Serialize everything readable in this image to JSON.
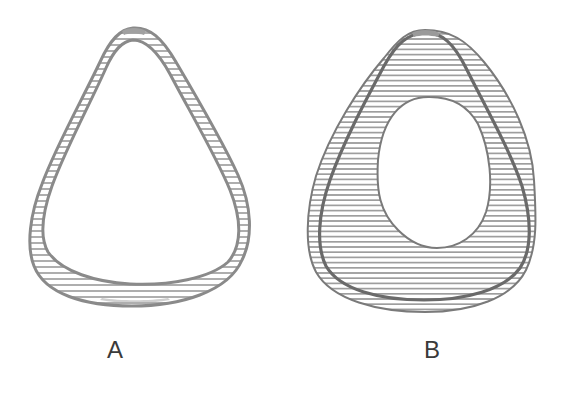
{
  "figure": {
    "panels": [
      {
        "label": "A",
        "description": "Thin-walled teardrop-shaped cross-section with horizontally hatched wall, thicker at the base"
      },
      {
        "label": "B",
        "description": "Thick-walled teardrop-shaped cross-section with horizontally hatched wall, inner outline of shape A overlaid as a dark line, and a smaller oval lumen"
      }
    ],
    "colors": {
      "outline": "#8a8a8a",
      "outline_dark": "#6a6a6a",
      "hatch": "#9a9a9a",
      "background": "#ffffff",
      "label": "#3a3a3a"
    }
  }
}
